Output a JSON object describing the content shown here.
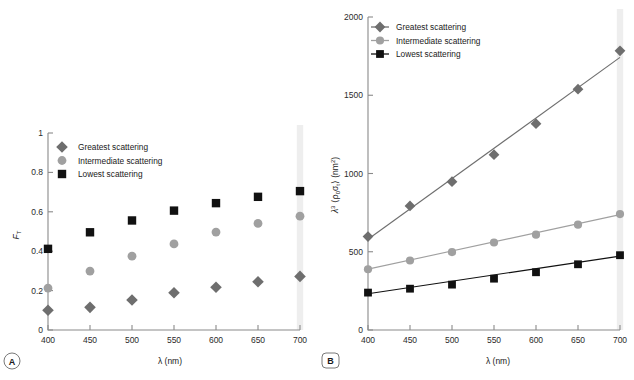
{
  "figure": {
    "background_color": "#ffffff",
    "series_colors": {
      "greatest": "#6e6e6e",
      "intermediate": "#a0a0a0",
      "lowest": "#111111"
    },
    "highlight_band_color": "#e8e8e8",
    "axis_color": "#8a8a8a"
  },
  "panels": [
    {
      "letter": "A",
      "badge_shape": "circle",
      "xlabel_lambda": "λ",
      "xlabel_unit": "(nm)",
      "ylabel_main": "F",
      "ylabel_sub": "T",
      "legend": [
        {
          "label": "Greatest scattering",
          "marker": "diamond",
          "color": "#6e6e6e"
        },
        {
          "label": "Intermediate scattering",
          "marker": "circle",
          "color": "#a0a0a0"
        },
        {
          "label": "Lowest scattering",
          "marker": "square",
          "color": "#111111"
        }
      ]
    },
    {
      "letter": "B",
      "badge_shape": "rounded-rect",
      "xlabel_lambda": "λ",
      "xlabel_unit": "(nm)",
      "ylabel_lambda": "λ",
      "ylabel_exp": "3",
      "ylabel_bracket_open": "⟨ρ",
      "ylabel_rho_sub": "0",
      "ylabel_sigma": "σ",
      "ylabel_sigma_sub": "t",
      "ylabel_bracket_close": "⟩",
      "ylabel_unit_open": "(nm",
      "ylabel_unit_exp": "2",
      "ylabel_unit_close": ")",
      "legend": [
        {
          "label": "Greatest scattering",
          "marker": "diamond",
          "color": "#6e6e6e"
        },
        {
          "label": "Intermediate scattering",
          "marker": "circle",
          "color": "#a0a0a0"
        },
        {
          "label": "Lowest scattering",
          "marker": "square",
          "color": "#111111"
        }
      ]
    }
  ],
  "chart_data": [
    {
      "type": "scatter",
      "panel": "A",
      "title": "",
      "xlabel": "λ (nm)",
      "ylabel": "F_T",
      "x": [
        400,
        450,
        500,
        550,
        600,
        650,
        700
      ],
      "xlim": [
        400,
        700
      ],
      "ylim": [
        0,
        1
      ],
      "xticks": [
        400,
        450,
        500,
        550,
        600,
        650,
        700
      ],
      "yticks": [
        0,
        0.2,
        0.4,
        0.6,
        0.8,
        1
      ],
      "ytick_labels": [
        "0",
        "0.2",
        "0.4",
        "0.6",
        "0.8",
        "1"
      ],
      "grid": false,
      "lines": false,
      "legend_position": "top-left",
      "highlight_x": 700,
      "series": [
        {
          "name": "Greatest scattering",
          "marker": "diamond",
          "color": "#6e6e6e",
          "values": [
            0.1,
            0.115,
            0.152,
            0.189,
            0.217,
            0.245,
            0.272
          ]
        },
        {
          "name": "Intermediate scattering",
          "marker": "circle",
          "color": "#a0a0a0",
          "values": [
            0.213,
            0.299,
            0.375,
            0.437,
            0.497,
            0.541,
            0.578
          ]
        },
        {
          "name": "Lowest scattering",
          "marker": "square",
          "color": "#111111",
          "values": [
            0.412,
            0.496,
            0.556,
            0.606,
            0.644,
            0.676,
            0.705
          ]
        }
      ]
    },
    {
      "type": "scatter",
      "panel": "B",
      "title": "",
      "xlabel": "λ (nm)",
      "ylabel": "λ³ ⟨ρ₀σₜ⟩ (nm²)",
      "x": [
        400,
        450,
        500,
        550,
        600,
        650,
        700
      ],
      "xlim": [
        400,
        700
      ],
      "ylim": [
        0,
        2000
      ],
      "xticks": [
        400,
        450,
        500,
        550,
        600,
        650,
        700
      ],
      "yticks": [
        0,
        500,
        1000,
        1500,
        2000
      ],
      "ytick_labels": [
        "0",
        "500",
        "1000",
        "1500",
        "2000"
      ],
      "grid": false,
      "lines": true,
      "legend_position": "top-left",
      "highlight_x": 700,
      "series": [
        {
          "name": "Greatest scattering",
          "marker": "diamond",
          "color": "#6e6e6e",
          "values": [
            597,
            793,
            948,
            1120,
            1318,
            1539,
            1784
          ],
          "fit": [
            [
              400,
              580
            ],
            [
              700,
              1742
            ]
          ]
        },
        {
          "name": "Intermediate scattering",
          "marker": "circle",
          "color": "#a0a0a0",
          "values": [
            388,
            444,
            498,
            559,
            609,
            673,
            741
          ],
          "fit": [
            [
              400,
              389
            ],
            [
              700,
              737
            ]
          ]
        },
        {
          "name": "Lowest scattering",
          "marker": "square",
          "color": "#111111",
          "values": [
            239,
            264,
            290,
            328,
            369,
            420,
            478
          ],
          "fit": [
            [
              400,
              232
            ],
            [
              700,
              472
            ]
          ]
        }
      ]
    }
  ]
}
